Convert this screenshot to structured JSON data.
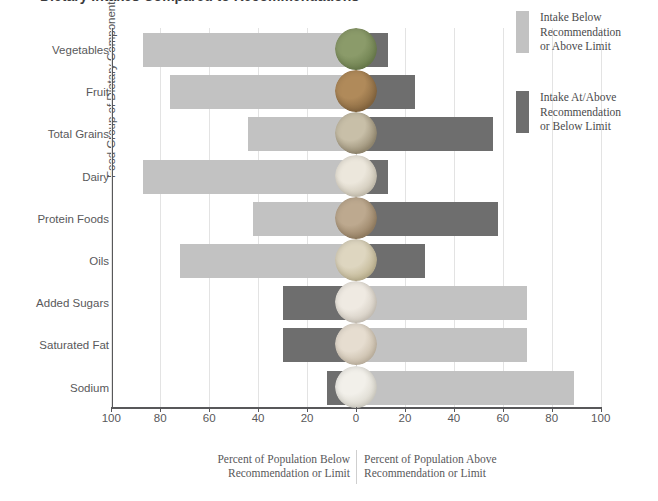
{
  "chart_data": {
    "type": "bar",
    "title": "Dietary Intakes Compared to Recommendations",
    "subtitle": "",
    "orientation": "horizontal-diverging",
    "categories": [
      "Vegetables",
      "Fruit",
      "Total Grains",
      "Dairy",
      "Protein Foods",
      "Oils",
      "Added Sugars",
      "Saturated Fat",
      "Sodium"
    ],
    "series": [
      {
        "name": "Percent of Population Below Recommendation or Limit",
        "values": [
          87,
          76,
          44,
          87,
          42,
          72,
          30,
          30,
          12
        ]
      },
      {
        "name": "Percent of Population Above Recommendation or Limit",
        "values": [
          13,
          24,
          56,
          13,
          58,
          28,
          70,
          70,
          89
        ]
      }
    ],
    "bar_styles": [
      {
        "category": "Vegetables",
        "left": "light",
        "right": "dark"
      },
      {
        "category": "Fruit",
        "left": "light",
        "right": "dark"
      },
      {
        "category": "Total Grains",
        "left": "light",
        "right": "dark"
      },
      {
        "category": "Dairy",
        "left": "light",
        "right": "dark"
      },
      {
        "category": "Protein Foods",
        "left": "light",
        "right": "dark"
      },
      {
        "category": "Oils",
        "left": "light",
        "right": "dark"
      },
      {
        "category": "Added Sugars",
        "left": "dark",
        "right": "light"
      },
      {
        "category": "Saturated Fat",
        "left": "dark",
        "right": "light"
      },
      {
        "category": "Sodium",
        "left": "dark",
        "right": "light"
      }
    ],
    "xlabel": "",
    "ylabel": "Food Group of Dietary Component",
    "xlim": [
      -100,
      100
    ],
    "xticks": [
      100,
      80,
      60,
      40,
      20,
      0,
      20,
      40,
      60,
      80,
      100
    ],
    "grid": true,
    "legend_position": "right"
  },
  "axis": {
    "y_title": "Food Group of Dietary Component",
    "tick_labels": [
      "100",
      "80",
      "60",
      "40",
      "20",
      "0",
      "20",
      "40",
      "60",
      "80",
      "100"
    ]
  },
  "captions": {
    "left_line1": "Percent of Population Below",
    "left_line2": "Recommendation or Limit",
    "right_line1": "Percent of Population Above",
    "right_line2": "Recommendation or Limit"
  },
  "legend": {
    "items": [
      {
        "swatch": "light",
        "line1": "Intake Below",
        "line2": "Recommendation",
        "line3": "or Above Limit"
      },
      {
        "swatch": "dark",
        "line1": "Intake At/Above",
        "line2": "Recommendation",
        "line3": "or Below Limit"
      }
    ]
  },
  "colors": {
    "light_bar": "#c2c2c2",
    "dark_bar": "#6e6e6e",
    "text": "#58585a",
    "gridline": "#e3e3e3",
    "background": "#ffffff"
  },
  "icons": [
    {
      "category": "Vegetables",
      "name": "vegetables-icon",
      "c1": "#8b9b6a",
      "c2": "#6f8150"
    },
    {
      "category": "Fruit",
      "name": "fruit-icon",
      "c1": "#b08a5a",
      "c2": "#8a6a42"
    },
    {
      "category": "Total Grains",
      "name": "grains-icon",
      "c1": "#c8bfa8",
      "c2": "#9a8f76"
    },
    {
      "category": "Dairy",
      "name": "dairy-icon",
      "c1": "#ece7dc",
      "c2": "#cfc8b8"
    },
    {
      "category": "Protein Foods",
      "name": "protein-foods-icon",
      "c1": "#bda98f",
      "c2": "#9a8467"
    },
    {
      "category": "Oils",
      "name": "oils-icon",
      "c1": "#ded6c0",
      "c2": "#c2b795"
    },
    {
      "category": "Added Sugars",
      "name": "added-sugars-icon",
      "c1": "#efeae2",
      "c2": "#d4cdc2"
    },
    {
      "category": "Saturated Fat",
      "name": "saturated-fat-icon",
      "c1": "#e6ddd0",
      "c2": "#c9bdaa"
    },
    {
      "category": "Sodium",
      "name": "sodium-icon",
      "c1": "#f2f0ea",
      "c2": "#dcd9cf"
    }
  ]
}
